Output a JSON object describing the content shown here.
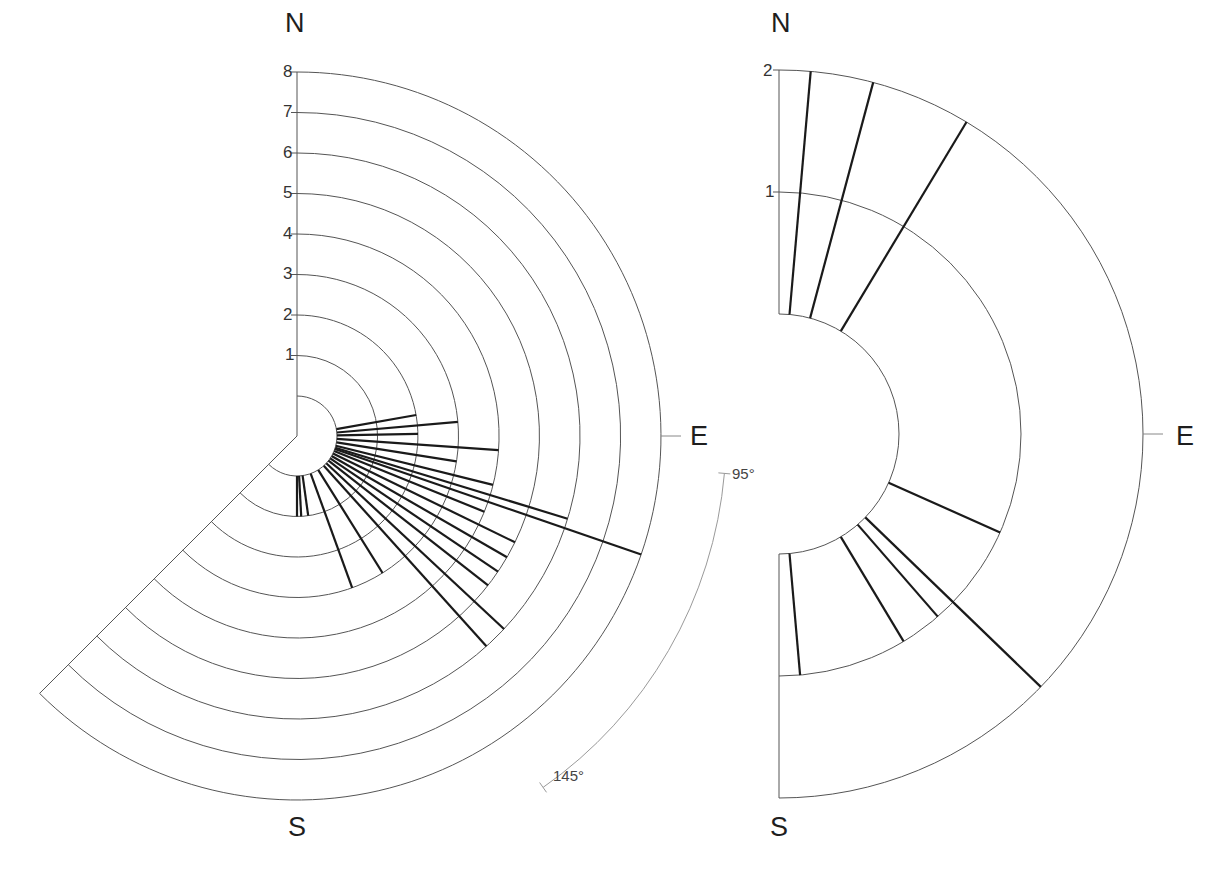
{
  "chart_data": [
    {
      "type": "rose",
      "panel": "left",
      "title": "",
      "direction_labels": {
        "north": "N",
        "east": "E",
        "south": "S"
      },
      "radial_ticks": [
        "1",
        "2",
        "3",
        "4",
        "5",
        "6",
        "7",
        "8"
      ],
      "rlim": [
        0,
        8
      ],
      "sector_deg": [
        0,
        225
      ],
      "angle_annotation": {
        "start": "95°",
        "end": "145°"
      },
      "center": [
        297,
        436
      ],
      "inner_radius_px": 40,
      "unit_px": 40.5,
      "rays": [
        {
          "azimuth": 80,
          "length": 2
        },
        {
          "azimuth": 85,
          "length": 3
        },
        {
          "azimuth": 89,
          "length": 2
        },
        {
          "azimuth": 94,
          "length": 4
        },
        {
          "azimuth": 99,
          "length": 3
        },
        {
          "azimuth": 104,
          "length": 4
        },
        {
          "azimuth": 107,
          "length": 6
        },
        {
          "azimuth": 109,
          "length": 8
        },
        {
          "azimuth": 112,
          "length": 4
        },
        {
          "azimuth": 116,
          "length": 5
        },
        {
          "azimuth": 120,
          "length": 5
        },
        {
          "azimuth": 124,
          "length": 5
        },
        {
          "azimuth": 128,
          "length": 5
        },
        {
          "azimuth": 133,
          "length": 6
        },
        {
          "azimuth": 138,
          "length": 6
        },
        {
          "azimuth": 148,
          "length": 3
        },
        {
          "azimuth": 160,
          "length": 3
        },
        {
          "azimuth": 172,
          "length": 1
        },
        {
          "azimuth": 177,
          "length": 1
        },
        {
          "azimuth": 180,
          "length": 1
        }
      ]
    },
    {
      "type": "rose",
      "panel": "right",
      "title": "",
      "direction_labels": {
        "north": "N",
        "east": "E",
        "south": "S"
      },
      "radial_ticks": [
        "1",
        "2"
      ],
      "rlim": [
        0,
        2
      ],
      "sector_deg": [
        0,
        180
      ],
      "center": [
        779,
        434
      ],
      "inner_radius_px": 120,
      "unit_px": 122,
      "rays": [
        {
          "azimuth": 5,
          "length": 2
        },
        {
          "azimuth": 15,
          "length": 2
        },
        {
          "azimuth": 31,
          "length": 2
        },
        {
          "azimuth": 114,
          "length": 1
        },
        {
          "azimuth": 134,
          "length": 2
        },
        {
          "azimuth": 139,
          "length": 1
        },
        {
          "azimuth": 149,
          "length": 1
        },
        {
          "azimuth": 175,
          "length": 1
        }
      ]
    }
  ],
  "colors": {
    "grid": "#555555",
    "ray": "#1a1a1a",
    "annotation": "#9a9a9a",
    "background": "#ffffff"
  }
}
